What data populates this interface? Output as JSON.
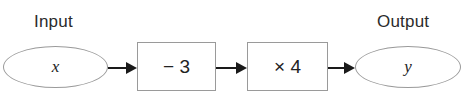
{
  "diagram": {
    "type": "function-machine",
    "clipped_top_text": "",
    "input": {
      "label": "Input",
      "variable": "x"
    },
    "steps": [
      {
        "operation": "− 3"
      },
      {
        "operation": "× 4"
      }
    ],
    "output": {
      "label": "Output",
      "variable": "y"
    },
    "colors": {
      "stroke": "#9a9a9a",
      "arrow": "#1a1a1a",
      "text": "#222222"
    }
  }
}
